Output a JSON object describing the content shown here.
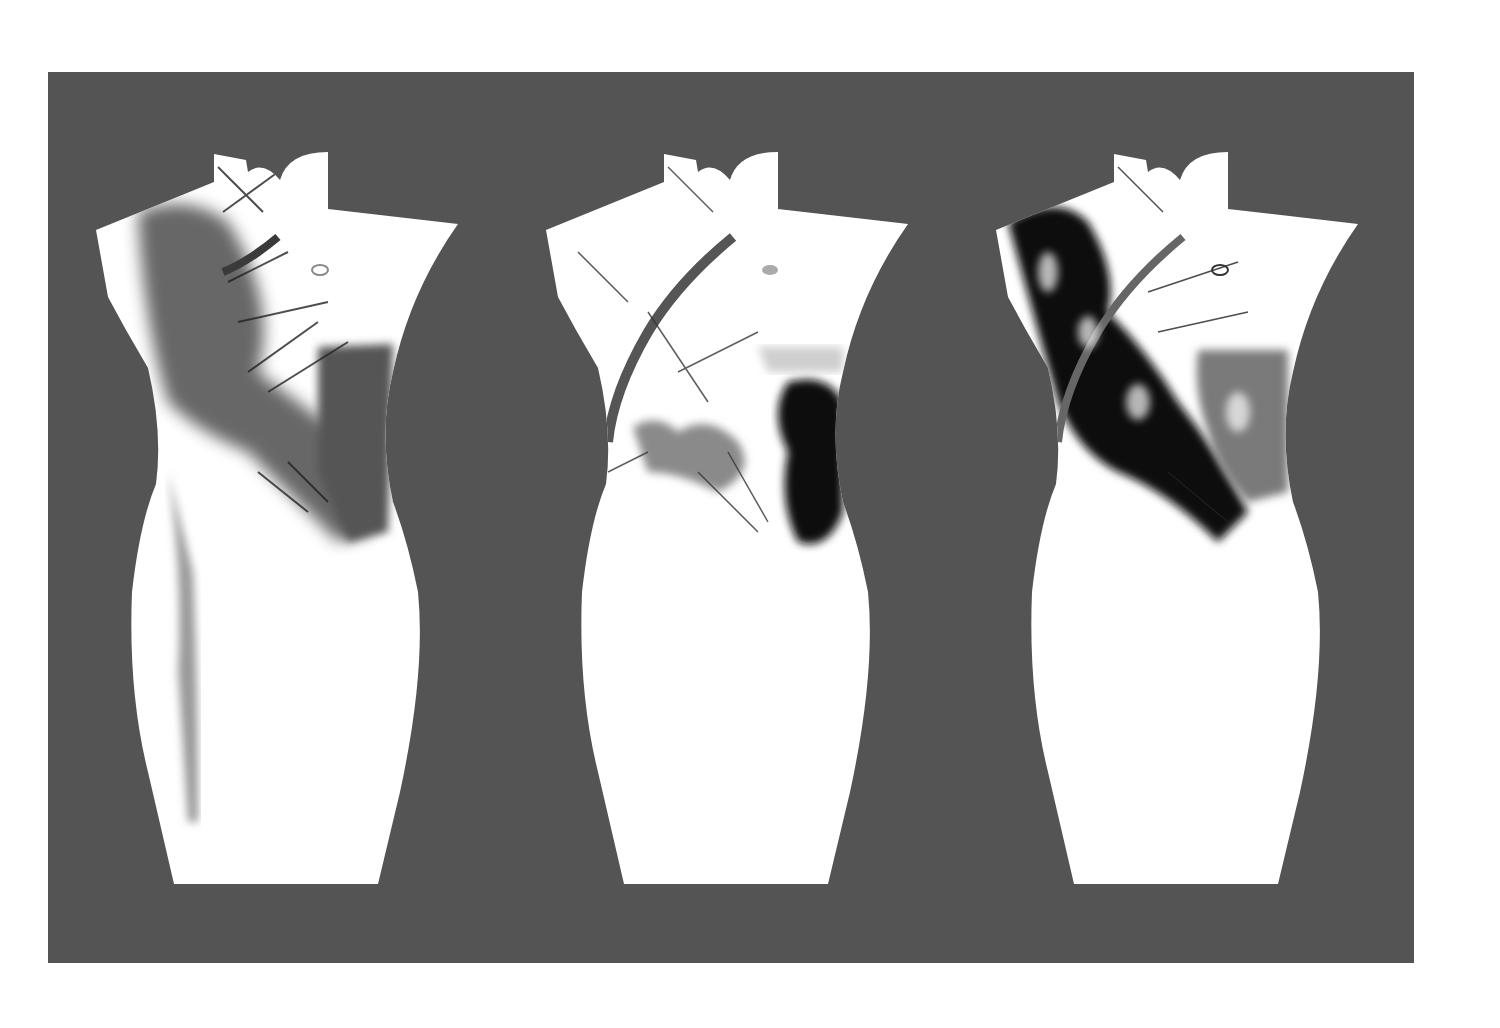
{
  "artwork": {
    "background_color": "#ffffff",
    "panel_color": "#545454",
    "dress_color": "#ffffff",
    "ink_colors": {
      "dark": "#111111",
      "mid": "#5c5c5c",
      "light": "#8a8a8a"
    },
    "figures": [
      {
        "id": "dress-1",
        "style": "grey ink wash",
        "offset_x": 0
      },
      {
        "id": "dress-2",
        "style": "black ink splash with grey patches",
        "offset_x": 450
      },
      {
        "id": "dress-3",
        "style": "heavy black ink splash",
        "offset_x": 900
      }
    ]
  }
}
